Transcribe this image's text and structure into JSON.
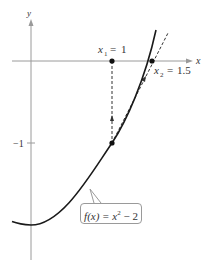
{
  "figure": {
    "function_label": "f(x) = x² − 2",
    "function_label_parts": {
      "lhs": "f(x) = x",
      "exp": "2",
      "rhs": " − 2"
    },
    "axis_labels": {
      "x": "x",
      "y": "y"
    },
    "tick_labels": {
      "y_minus_1": "−1"
    },
    "points": {
      "x1": {
        "label": "x₁ = 1",
        "sub": "1",
        "value": "1"
      },
      "x2": {
        "label": "x₂ = 1.5",
        "sub": "2",
        "value": "1.5"
      }
    }
  },
  "colors": {
    "axis": "#9a9a9a",
    "curve": "#1a1a1a",
    "dashed": "#333333",
    "text": "#333333"
  }
}
